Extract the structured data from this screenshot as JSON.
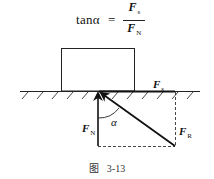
{
  "formula": {
    "lhs": "tanα",
    "equals": "=",
    "numerator": {
      "symbol": "F",
      "subscript": "s"
    },
    "denominator": {
      "symbol": "F",
      "subscript": "N"
    }
  },
  "diagram": {
    "block": {
      "x": 61,
      "y": 48,
      "width": 73,
      "height": 43
    },
    "ground": {
      "y": 91,
      "x_start": 20,
      "x_end": 200
    },
    "forces": {
      "F_N": {
        "label": "F",
        "subscript": "N",
        "direction": "up",
        "from": [
          98,
          146
        ],
        "to": [
          98,
          92
        ]
      },
      "F_R": {
        "label": "F",
        "subscript": "R",
        "direction": "up-left",
        "from": [
          175,
          146
        ],
        "to": [
          100,
          92
        ]
      },
      "F_s": {
        "label": "F",
        "subscript": "s",
        "direction": "horizontal-right",
        "from": [
          98,
          91
        ],
        "to": [
          175,
          91
        ]
      }
    },
    "angle_label": "α",
    "colors": {
      "line": "#111111",
      "dashed": "#333333",
      "background": "#ffffff"
    }
  },
  "caption": {
    "prefix": "图",
    "number": "3-13"
  }
}
